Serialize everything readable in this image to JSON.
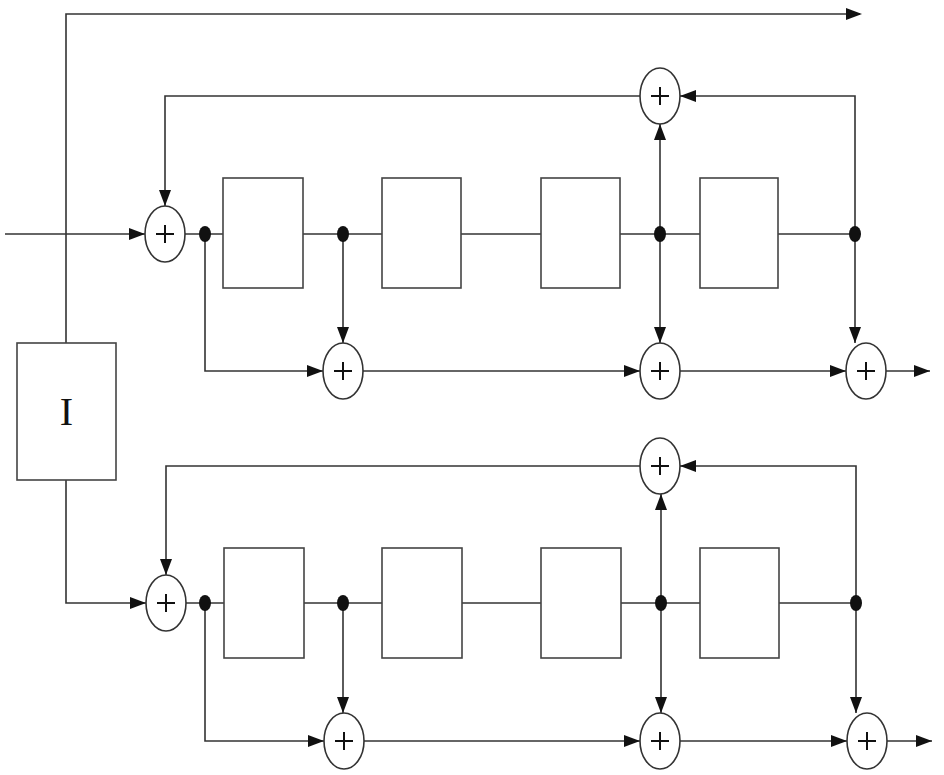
{
  "diagram": {
    "title": "",
    "type": "block-diagram",
    "colors": {
      "line": "#333333",
      "fill": "#ffffff",
      "node": "#111111"
    },
    "interleaver": {
      "label": "I",
      "x": 17,
      "y": 343,
      "w": 99,
      "h": 137
    },
    "systematic_line": {
      "x": 66,
      "y": 14,
      "x_end": 860
    },
    "input": {
      "x_start": 5
    },
    "encoders": [
      {
        "name": "encoder-1",
        "main_y": 234,
        "feedback_y": 96,
        "output_y": 371,
        "box_y": 178,
        "box_h": 110,
        "boxes": [
          {
            "x": 223,
            "w": 80
          },
          {
            "x": 382,
            "w": 79
          },
          {
            "x": 541,
            "w": 79
          },
          {
            "x": 700,
            "w": 78
          }
        ],
        "input_adder_x": 165,
        "taps_x": [
          205,
          343,
          660,
          855
        ],
        "feedback_adder_x": 660,
        "output_adders_x": [
          343,
          660,
          866
        ],
        "output_end_x": 930,
        "adder_symbol": "+"
      },
      {
        "name": "encoder-2",
        "main_y": 603,
        "feedback_y": 466,
        "output_y": 741,
        "box_y": 548,
        "box_h": 110,
        "boxes": [
          {
            "x": 224,
            "w": 80
          },
          {
            "x": 382,
            "w": 80
          },
          {
            "x": 541,
            "w": 80
          },
          {
            "x": 700,
            "w": 79
          }
        ],
        "input_adder_x": 166,
        "taps_x": [
          205,
          343,
          661,
          856
        ],
        "feedback_adder_x": 660,
        "output_adders_x": [
          344,
          660,
          867
        ],
        "output_end_x": 932,
        "adder_symbol": "+"
      }
    ]
  }
}
